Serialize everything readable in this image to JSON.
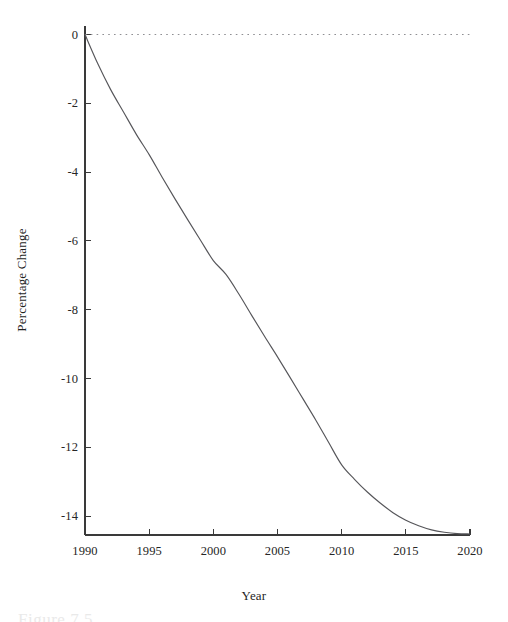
{
  "figure": {
    "background": "#ffffff",
    "line_color": "#56565a",
    "axis_color": "#3a3a3a",
    "reference_line_color": "#8f8f93",
    "caption_partial": "Figure 7.5"
  },
  "chart_data": {
    "type": "line",
    "title": "",
    "subtitle": "",
    "xlabel": "Year",
    "ylabel": "Percentage Change",
    "xlim": [
      1990,
      2020
    ],
    "ylim": [
      -14.55,
      0.25
    ],
    "grid": false,
    "legend": null,
    "xticks": [
      1990,
      1995,
      2000,
      2005,
      2010,
      2015,
      2020
    ],
    "xtick_labels": [
      "1990",
      "1995",
      "2000",
      "2005",
      "2010",
      "2015",
      "2020"
    ],
    "yticks": [
      0,
      -2,
      -4,
      -6,
      -8,
      -10,
      -12,
      -14
    ],
    "ytick_labels": [
      "0",
      "-2",
      "-4",
      "-6",
      "-8",
      "-10",
      "-12",
      "-14"
    ],
    "annotations": [
      {
        "name": "zero-reference-line",
        "type": "hline",
        "y": 0,
        "style": "dotted",
        "x_start": 1990,
        "x_end": 2020
      }
    ],
    "series": [
      {
        "name": "Percentage Change",
        "x": [
          1990,
          1991,
          1992,
          1993,
          1994,
          1995,
          1996,
          1997,
          1998,
          1999,
          2000,
          2001,
          2002,
          2003,
          2004,
          2005,
          2006,
          2007,
          2008,
          2009,
          2010,
          2011,
          2012,
          2013,
          2014,
          2015,
          2016,
          2017,
          2018,
          2019,
          2020
        ],
        "values": [
          0.0,
          -0.85,
          -1.6,
          -2.25,
          -2.9,
          -3.49,
          -4.14,
          -4.77,
          -5.38,
          -5.98,
          -6.57,
          -6.98,
          -7.55,
          -8.17,
          -8.78,
          -9.37,
          -9.98,
          -10.6,
          -11.22,
          -11.87,
          -12.51,
          -12.93,
          -13.3,
          -13.62,
          -13.9,
          -14.12,
          -14.28,
          -14.4,
          -14.47,
          -14.51,
          -14.52
        ]
      }
    ]
  },
  "axis_titles": {
    "x": "Year",
    "y": "Percentage Change"
  }
}
